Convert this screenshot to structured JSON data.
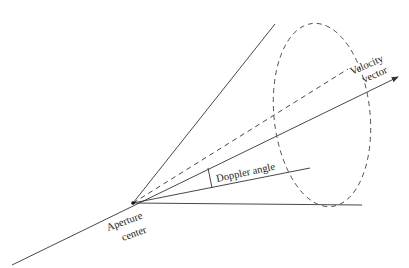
{
  "diagram": {
    "type": "doppler-cone",
    "colors": {
      "stroke": "#333333",
      "text": "#222222",
      "background": "#ffffff"
    },
    "labels": {
      "velocity_line1": "Velocity",
      "velocity_line2": "vector",
      "doppler": "Doppler angle",
      "aperture_line1": "Aperture",
      "aperture_line2": "center"
    },
    "points": {
      "apex": [
        133,
        203
      ],
      "axis_start": [
        12,
        265
      ],
      "axis_tip": [
        398,
        77
      ],
      "cone_top": [
        274,
        25
      ],
      "cone_bottom": [
        362,
        206
      ],
      "dashed_end": [
        348,
        70
      ],
      "doppler_ray_end": [
        309,
        168
      ]
    },
    "ellipse": {
      "cx": 320,
      "cy": 115,
      "rx": 48,
      "ry": 92
    }
  }
}
